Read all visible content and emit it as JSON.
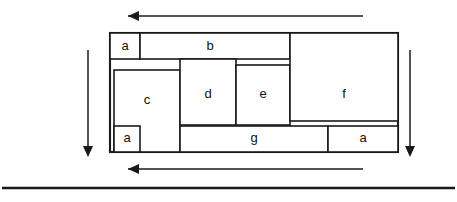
{
  "diagram": {
    "canvas": {
      "width": 457,
      "height": 202
    },
    "colors": {
      "background": "#ffffff",
      "stroke": "#1a1a1a",
      "label": "#111111"
    },
    "outer_frame": {
      "x": 110,
      "y": 33,
      "width": 288,
      "height": 119
    },
    "blocks": [
      {
        "id": "a-top-left",
        "label": "a",
        "x": 110,
        "y": 33,
        "width": 30,
        "height": 26,
        "label_x": 125,
        "label_y": 47
      },
      {
        "id": "b",
        "label": "b",
        "x": 140,
        "y": 33,
        "width": 150,
        "height": 26,
        "label_x": 210,
        "label_y": 47
      },
      {
        "id": "a-top-right",
        "label": "a",
        "x": 332,
        "y": 38,
        "width": 66,
        "height": 21,
        "label_x": 365,
        "label_y": 49
      },
      {
        "id": "c",
        "label": "c",
        "x": 114,
        "y": 70,
        "width": 66,
        "height": 82,
        "label_x": 147,
        "label_y": 101
      },
      {
        "id": "a-in-c",
        "label": "a",
        "x": 114,
        "y": 126,
        "width": 26,
        "height": 26,
        "label_x": 127,
        "label_y": 139
      },
      {
        "id": "d",
        "label": "d",
        "x": 180,
        "y": 59,
        "width": 56,
        "height": 66,
        "label_x": 208,
        "label_y": 95
      },
      {
        "id": "e",
        "label": "e",
        "x": 236,
        "y": 65,
        "width": 54,
        "height": 60,
        "label_x": 263,
        "label_y": 95
      },
      {
        "id": "f",
        "label": "f",
        "x": 290,
        "y": 33,
        "width": 108,
        "height": 88,
        "label_x": 344,
        "label_y": 95
      },
      {
        "id": "g",
        "label": "g",
        "x": 180,
        "y": 126,
        "width": 148,
        "height": 26,
        "label_x": 254,
        "label_y": 139
      },
      {
        "id": "a-bottom-right",
        "label": "a",
        "x": 328,
        "y": 126,
        "width": 70,
        "height": 26,
        "label_x": 363,
        "label_y": 139
      }
    ],
    "arrows": [
      {
        "id": "arrow-top",
        "direction": "left",
        "x1": 363,
        "y1": 16,
        "x2": 128,
        "y2": 16
      },
      {
        "id": "arrow-bottom",
        "direction": "left",
        "x1": 363,
        "y1": 169,
        "x2": 128,
        "y2": 169
      },
      {
        "id": "arrow-left",
        "direction": "down",
        "x1": 88,
        "y1": 50,
        "x2": 88,
        "y2": 146
      },
      {
        "id": "arrow-right",
        "direction": "down",
        "x1": 410,
        "y1": 50,
        "x2": 410,
        "y2": 146
      }
    ],
    "baseline_rule": {
      "x1": 2,
      "y1": 188,
      "x2": 455,
      "y2": 188
    }
  }
}
